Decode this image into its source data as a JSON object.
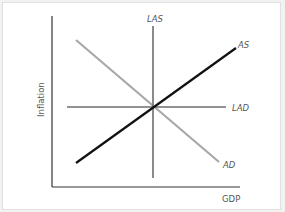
{
  "diagram": {
    "type": "economics-aggregate-supply-demand",
    "axes": {
      "x_label": "GDP",
      "y_label": "Inflation"
    },
    "curves": [
      {
        "id": "LAS",
        "label": "LAS",
        "kind": "vertical",
        "color": "#6e6e6e"
      },
      {
        "id": "LAD",
        "label": "LAD",
        "kind": "horizontal",
        "color": "#6e6e6e"
      },
      {
        "id": "AS",
        "label": "AS",
        "kind": "upward-sloping",
        "color": "#111111"
      },
      {
        "id": "AD",
        "label": "AD",
        "kind": "downward-sloping",
        "color": "#a8a8a8"
      }
    ],
    "intersection": "all four curves intersect at a single equilibrium point"
  },
  "colors": {
    "axis": "#333333",
    "background": "#ffffff",
    "frame_border": "#e0e0e0"
  }
}
